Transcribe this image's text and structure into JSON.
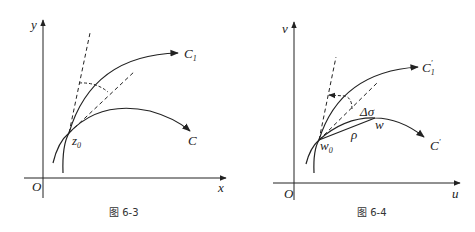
{
  "figures": [
    {
      "id": "fig-6-3",
      "caption": "图 6-3",
      "axes": {
        "x_label": "x",
        "y_label": "y",
        "origin": "O"
      },
      "curves": [
        {
          "name": "C",
          "main": "C",
          "sub": ""
        },
        {
          "name": "C1",
          "main": "C",
          "sub": "1"
        }
      ],
      "point": {
        "main": "z",
        "sub": "0"
      }
    },
    {
      "id": "fig-6-4",
      "caption": "图 6-4",
      "axes": {
        "x_label": "u",
        "y_label": "v",
        "origin": "O"
      },
      "curves": [
        {
          "name": "C'",
          "main": "C",
          "sup": "′"
        },
        {
          "name": "C1'",
          "main": "C",
          "sub": "1",
          "sup": "′"
        }
      ],
      "point": {
        "main": "w",
        "sub": "0"
      },
      "extra_labels": {
        "delta_sigma": "Δσ",
        "rho": "ρ",
        "w": "w"
      }
    }
  ],
  "colors": {
    "stroke": "#222222",
    "background": "#ffffff"
  }
}
